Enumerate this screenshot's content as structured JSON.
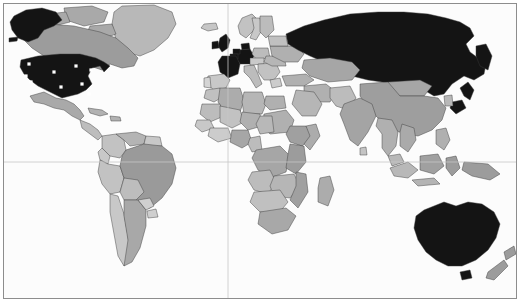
{
  "map": {
    "title": "World map",
    "projection": "equirectangular",
    "background_color": "#fcfcfc",
    "ocean_color": "#fcfcfc",
    "border_color": "#8d8d8d",
    "country_outline_color": "#3a3a3a",
    "graticule_color": "#c6c6c6",
    "legend_note": "",
    "highlight_color": "#141414",
    "shade_colors": {
      "highlight": "#141414",
      "medium_dark": "#8e8e8e",
      "medium": "#a4a4a4",
      "light": "#bcbcbc",
      "very_light": "#d4d4d4"
    },
    "graticule": {
      "equator_y_px": 162,
      "prime_meridian_x_px": 228,
      "show_equator": true,
      "show_prime_meridian": true
    },
    "highlighted_countries": [
      "United States",
      "Alaska",
      "United Kingdom",
      "Ireland",
      "France",
      "Germany",
      "Netherlands",
      "Belgium",
      "Denmark",
      "Russia",
      "Japan",
      "Australia"
    ],
    "markers": {
      "marker_name": "city-marker",
      "marker_color": "#ffffff",
      "marker_shape": "square",
      "count": 9,
      "points": [
        {
          "label": "Seattle",
          "x": 25,
          "y": 60
        },
        {
          "label": "San Francisco",
          "x": 22,
          "y": 72
        },
        {
          "label": "Los Angeles",
          "x": 27,
          "y": 78
        },
        {
          "label": "Denver",
          "x": 50,
          "y": 68
        },
        {
          "label": "Dallas",
          "x": 57,
          "y": 83
        },
        {
          "label": "Chicago",
          "x": 72,
          "y": 62
        },
        {
          "label": "Atlanta",
          "x": 78,
          "y": 80
        },
        {
          "label": "New York",
          "x": 87,
          "y": 66
        },
        {
          "label": "Miami",
          "x": 85,
          "y": 90
        }
      ]
    },
    "regions": [
      {
        "name": "North America",
        "shade": "medium"
      },
      {
        "name": "South America",
        "shade": "light"
      },
      {
        "name": "Europe",
        "shade": "light"
      },
      {
        "name": "Africa",
        "shade": "light"
      },
      {
        "name": "Asia",
        "shade": "medium"
      },
      {
        "name": "Oceania",
        "shade": "medium"
      }
    ]
  }
}
